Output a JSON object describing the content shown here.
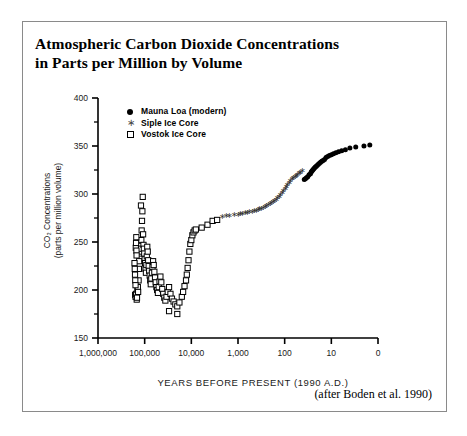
{
  "figure": {
    "title_line_1": "Atmospheric Carbon Dioxide Concentrations",
    "title_line_2": "in Parts per Million by Volume",
    "credit": "(after Boden et al. 1990)"
  },
  "chart_data": {
    "type": "scatter",
    "title": "Atmospheric Carbon Dioxide Concentrations in Parts per Million by Volume",
    "xlabel": "YEARS BEFORE PRESENT (1990 A.D.)",
    "ylabel": "CO2 Concentrations (parts per million volume)",
    "ylabel_line_1": "CO₂ Concentrations",
    "ylabel_line_2": "(parts per million volume)",
    "x_scale": "log-reversed",
    "xlim": [
      1000000,
      1
    ],
    "ylim": [
      150,
      400
    ],
    "y_major_step": 50,
    "y_minor_step": 25,
    "grid": false,
    "legend_position": "top-left-inside",
    "x_tick_labels": [
      "1,000,000",
      "100,000",
      "10,000",
      "1,000",
      "100",
      "10",
      "0"
    ],
    "x_tick_values": [
      1000000,
      100000,
      10000,
      1000,
      100,
      10,
      1
    ],
    "y_tick_labels": [
      "400",
      "350",
      "300",
      "250",
      "200",
      "150"
    ],
    "y_tick_values": [
      400,
      350,
      300,
      250,
      200,
      150
    ],
    "series": [
      {
        "name": "Mauna Loa (modern)",
        "marker": "filled-circle",
        "color": "#000000",
        "points": [
          [
            38,
            315
          ],
          [
            36,
            316
          ],
          [
            34,
            317
          ],
          [
            32,
            318
          ],
          [
            30,
            320
          ],
          [
            28,
            321
          ],
          [
            27,
            323
          ],
          [
            26,
            324
          ],
          [
            25,
            325
          ],
          [
            24,
            326
          ],
          [
            23,
            327
          ],
          [
            22,
            328
          ],
          [
            21,
            329
          ],
          [
            20,
            330
          ],
          [
            19,
            331
          ],
          [
            18,
            332
          ],
          [
            17,
            333
          ],
          [
            16,
            334
          ],
          [
            15,
            335
          ],
          [
            14,
            336
          ],
          [
            13,
            338
          ],
          [
            12,
            339
          ],
          [
            11,
            340
          ],
          [
            10,
            341
          ],
          [
            9,
            342
          ],
          [
            8,
            343
          ],
          [
            7,
            344
          ],
          [
            6,
            345
          ],
          [
            5,
            346
          ],
          [
            4,
            348
          ],
          [
            3,
            349
          ],
          [
            2,
            350
          ],
          [
            1.5,
            351
          ]
        ]
      },
      {
        "name": "Siple Ice Core",
        "marker": "asterisk",
        "color": "#333333",
        "points": [
          [
            2200,
            277
          ],
          [
            1800,
            278
          ],
          [
            1500,
            278
          ],
          [
            1200,
            279
          ],
          [
            1000,
            279
          ],
          [
            900,
            280
          ],
          [
            800,
            280
          ],
          [
            700,
            281
          ],
          [
            620,
            281
          ],
          [
            560,
            282
          ],
          [
            500,
            282
          ],
          [
            450,
            283
          ],
          [
            410,
            283
          ],
          [
            370,
            284
          ],
          [
            340,
            285
          ],
          [
            310,
            285
          ],
          [
            285,
            286
          ],
          [
            262,
            287
          ],
          [
            240,
            288
          ],
          [
            222,
            289
          ],
          [
            205,
            290
          ],
          [
            190,
            291
          ],
          [
            176,
            292
          ],
          [
            163,
            293
          ],
          [
            151,
            294
          ],
          [
            140,
            296
          ],
          [
            130,
            298
          ],
          [
            121,
            300
          ],
          [
            113,
            302
          ],
          [
            105,
            304
          ],
          [
            98,
            306
          ],
          [
            91,
            308
          ],
          [
            85,
            310
          ],
          [
            79,
            312
          ],
          [
            74,
            314
          ],
          [
            69,
            316
          ],
          [
            64,
            317
          ],
          [
            60,
            318
          ],
          [
            56,
            319
          ],
          [
            52,
            320
          ],
          [
            48,
            322
          ],
          [
            45,
            323
          ],
          [
            42,
            325
          ]
        ]
      },
      {
        "name": "Vostok Ice Core",
        "marker": "open-square",
        "color": "#000000",
        "points": [
          [
            160000,
            195
          ],
          [
            157000,
            193
          ],
          [
            152000,
            196
          ],
          [
            148000,
            190
          ],
          [
            146000,
            192
          ],
          [
            143000,
            200
          ],
          [
            140000,
            203
          ],
          [
            138000,
            198
          ],
          [
            135000,
            210
          ],
          [
            133000,
            222
          ],
          [
            131000,
            230
          ],
          [
            130000,
            238
          ],
          [
            128000,
            245
          ],
          [
            126000,
            248
          ],
          [
            125000,
            252
          ],
          [
            124000,
            246
          ],
          [
            122000,
            240
          ],
          [
            120000,
            243
          ],
          [
            118000,
            252
          ],
          [
            116000,
            262
          ],
          [
            114000,
            272
          ],
          [
            112000,
            282
          ],
          [
            110000,
            297
          ],
          [
            108000,
            258
          ],
          [
            106000,
            247
          ],
          [
            104000,
            243
          ],
          [
            102000,
            238
          ],
          [
            100000,
            232
          ],
          [
            98000,
            228
          ],
          [
            96000,
            222
          ],
          [
            94000,
            218
          ],
          [
            92000,
            226
          ],
          [
            90000,
            235
          ],
          [
            88000,
            245
          ],
          [
            86000,
            240
          ],
          [
            84000,
            231
          ],
          [
            82000,
            225
          ],
          [
            80000,
            220
          ],
          [
            78000,
            215
          ],
          [
            76000,
            210
          ],
          [
            74000,
            206
          ],
          [
            72000,
            212
          ],
          [
            70000,
            218
          ],
          [
            68000,
            224
          ],
          [
            66000,
            230
          ],
          [
            64000,
            226
          ],
          [
            62000,
            219
          ],
          [
            60000,
            213
          ],
          [
            58000,
            208
          ],
          [
            56000,
            203
          ],
          [
            54000,
            200
          ],
          [
            52000,
            197
          ],
          [
            50000,
            203
          ],
          [
            48000,
            209
          ],
          [
            46000,
            214
          ],
          [
            44000,
            208
          ],
          [
            42000,
            201
          ],
          [
            40000,
            196
          ],
          [
            38000,
            192
          ],
          [
            36000,
            189
          ],
          [
            34000,
            193
          ],
          [
            32000,
            198
          ],
          [
            30000,
            203
          ],
          [
            28000,
            196
          ],
          [
            26000,
            191
          ],
          [
            24000,
            188
          ],
          [
            22000,
            185
          ],
          [
            20000,
            183
          ],
          [
            18000,
            187
          ],
          [
            16000,
            193
          ],
          [
            15000,
            198
          ],
          [
            14000,
            204
          ],
          [
            13000,
            210
          ],
          [
            12500,
            216
          ],
          [
            12000,
            223
          ],
          [
            11500,
            231
          ],
          [
            11000,
            240
          ],
          [
            10500,
            248
          ],
          [
            10000,
            252
          ],
          [
            9500,
            257
          ],
          [
            9000,
            260
          ],
          [
            8500,
            262
          ],
          [
            8000,
            263
          ],
          [
            6000,
            265
          ],
          [
            4500,
            268
          ],
          [
            3500,
            272
          ],
          [
            2800,
            273
          ],
          [
            30000,
            178
          ],
          [
            155000,
            244
          ],
          [
            153000,
            249
          ],
          [
            151000,
            255
          ],
          [
            150000,
            241
          ],
          [
            149000,
            236
          ],
          [
            165000,
            228
          ],
          [
            163000,
            222
          ],
          [
            161000,
            216
          ],
          [
            159000,
            210
          ],
          [
            157000,
            205
          ],
          [
            120000,
            288
          ],
          [
            20000,
            175
          ]
        ]
      }
    ]
  },
  "legend": {
    "items": [
      {
        "label": "Mauna Loa (modern)",
        "marker": "filled-circle"
      },
      {
        "label": "Siple Ice Core",
        "marker": "asterisk"
      },
      {
        "label": "Vostok Ice Core",
        "marker": "open-square"
      }
    ]
  }
}
